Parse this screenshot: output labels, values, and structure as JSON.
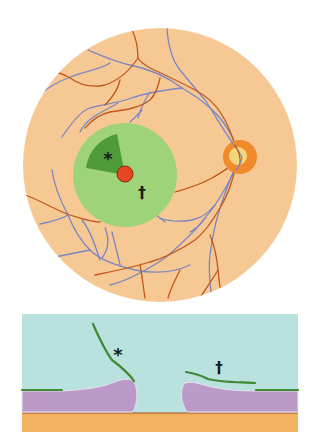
{
  "figure": {
    "fundus_view": {
      "labels": {
        "asterisk": "*",
        "dagger": "†"
      },
      "colors": {
        "retina_background": "#f6c994",
        "macula_zone": "#9fd37a",
        "detached_flap_sector": "#4f9b3a",
        "macular_hole": "#e8461f",
        "optic_disc_ring": "#f08a2a",
        "optic_disc_center": "#f5d67a",
        "artery": "#c4561c",
        "vein": "#7a86c4"
      }
    },
    "cross_section": {
      "labels": {
        "asterisk": "*",
        "dagger": "†"
      },
      "colors": {
        "vitreous": "#b9e1de",
        "retina_tissue": "#bb9ac8",
        "membrane": "#3f8a34",
        "rpe_line": "#a8481c",
        "choroid": "#f2b160"
      }
    }
  }
}
